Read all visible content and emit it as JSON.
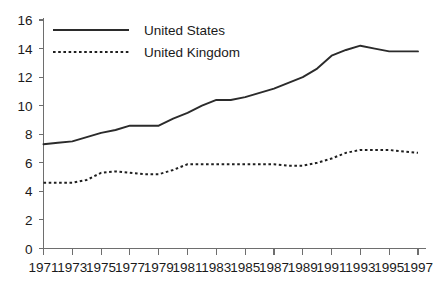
{
  "chart_data": {
    "type": "line",
    "title": "",
    "subtitle": "",
    "xlabel": "",
    "ylabel": "",
    "xlim": [
      1971,
      1997
    ],
    "ylim": [
      0,
      16
    ],
    "grid": false,
    "legend_position": "top-left",
    "x": [
      1971,
      1972,
      1973,
      1974,
      1975,
      1976,
      1977,
      1978,
      1979,
      1980,
      1981,
      1982,
      1983,
      1984,
      1985,
      1986,
      1987,
      1988,
      1989,
      1990,
      1991,
      1992,
      1993,
      1994,
      1995,
      1996,
      1997
    ],
    "x_tick_labels": [
      "1971",
      "1973",
      "1975",
      "1977",
      "1979",
      "1981",
      "1983",
      "1985",
      "1987",
      "1989",
      "1991",
      "1993",
      "1995",
      "1997"
    ],
    "x_ticks": [
      1971,
      1973,
      1975,
      1977,
      1979,
      1981,
      1983,
      1985,
      1987,
      1989,
      1991,
      1993,
      1995,
      1997
    ],
    "y_tick_labels": [
      "0",
      "2",
      "4",
      "6",
      "8",
      "10",
      "12",
      "14",
      "16"
    ],
    "y_ticks": [
      0,
      2,
      4,
      6,
      8,
      10,
      12,
      14,
      16
    ],
    "series": [
      {
        "name": "United States",
        "style": "solid",
        "color": "#2b2b2b",
        "values": [
          7.3,
          7.4,
          7.5,
          7.8,
          8.1,
          8.3,
          8.6,
          8.6,
          8.6,
          9.1,
          9.5,
          10.0,
          10.4,
          10.4,
          10.6,
          10.9,
          11.2,
          11.6,
          12.0,
          12.6,
          13.5,
          13.9,
          14.2,
          14.0,
          13.8,
          13.8,
          13.8
        ]
      },
      {
        "name": "United Kingdom",
        "style": "dotted",
        "color": "#1f1f1f",
        "values": [
          4.6,
          4.6,
          4.6,
          4.8,
          5.3,
          5.4,
          5.3,
          5.2,
          5.2,
          5.5,
          5.9,
          5.9,
          5.9,
          5.9,
          5.9,
          5.9,
          5.9,
          5.8,
          5.8,
          6.0,
          6.3,
          6.7,
          6.9,
          6.9,
          6.9,
          6.8,
          6.7
        ]
      }
    ]
  },
  "legend": {
    "entries": [
      {
        "label": "United States",
        "style": "solid"
      },
      {
        "label": "United Kingdom",
        "style": "dotted"
      }
    ]
  },
  "axes": {
    "y_axis_name": "y-axis",
    "x_axis_name": "x-axis"
  }
}
